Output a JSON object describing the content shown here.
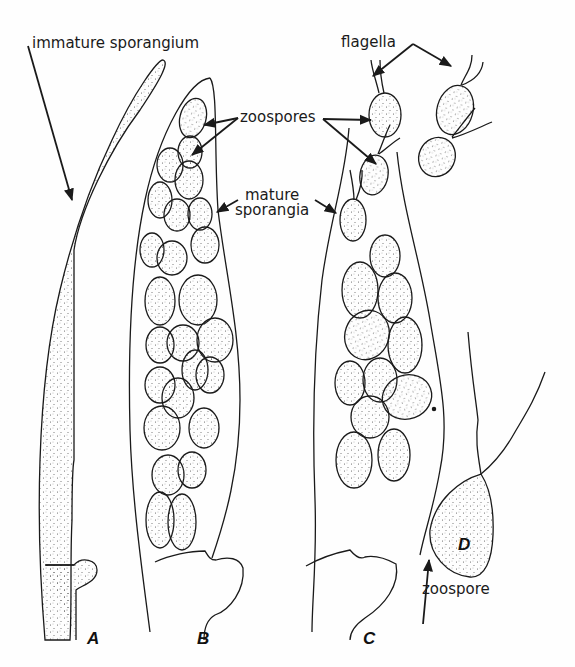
{
  "figure": {
    "labels": {
      "immature_sporangium": "immature sporangium",
      "zoospores": "zoospores",
      "mature_sporangia_line1": "mature",
      "mature_sporangia_line2": "sporangia",
      "flagella": "flagella",
      "zoospore": "zoospore"
    },
    "panels": [
      "A",
      "B",
      "C",
      "D"
    ],
    "colors": {
      "ink": "#1a1a1a",
      "background": "#fefefe",
      "stipple": "#555555"
    }
  }
}
